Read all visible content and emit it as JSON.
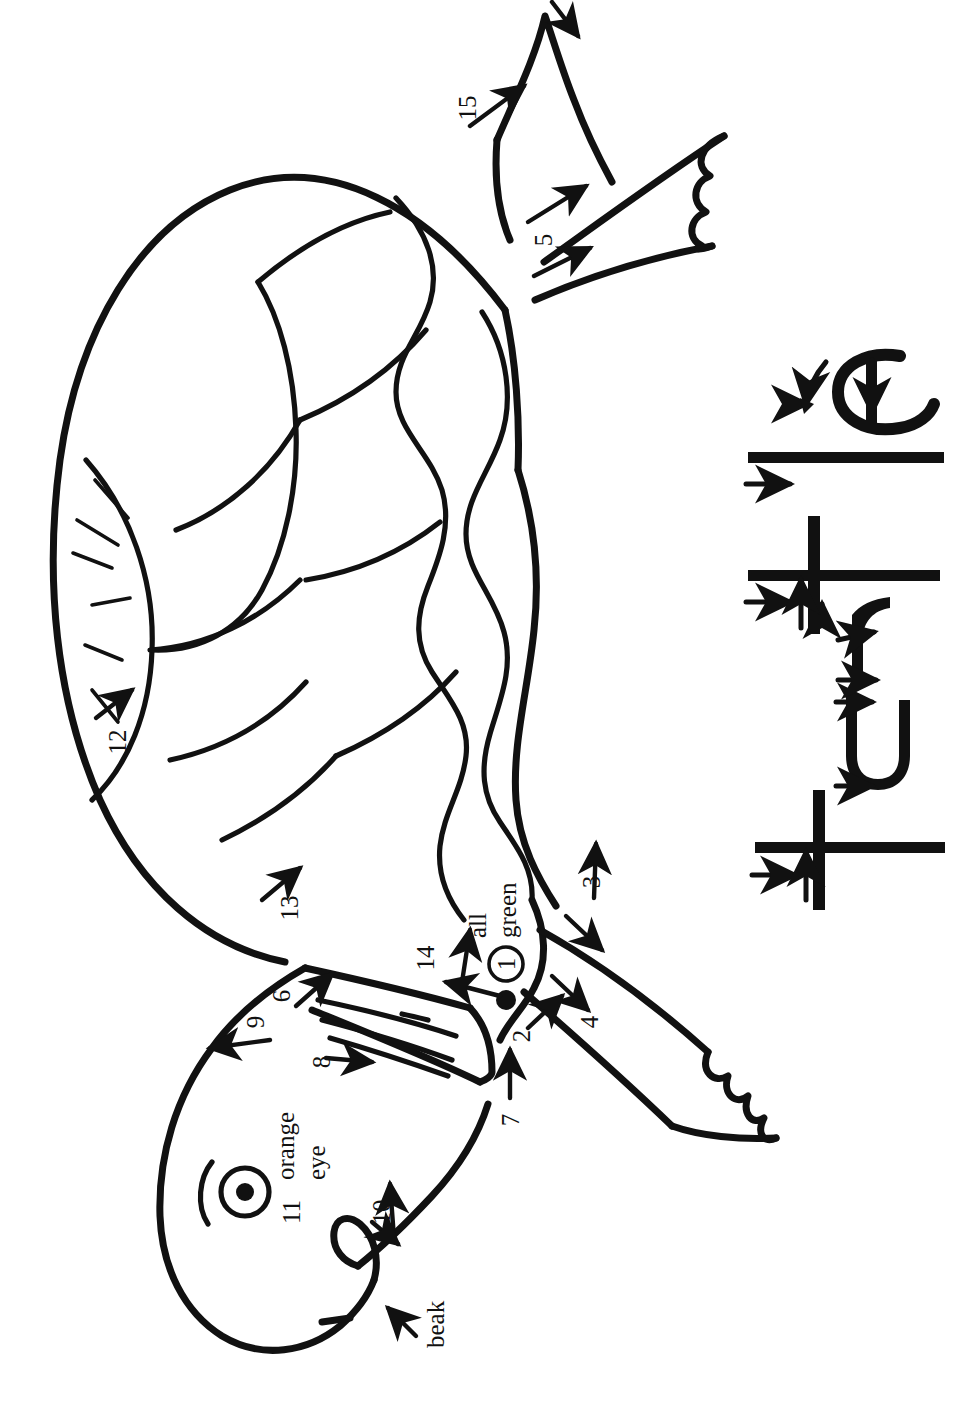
{
  "worksheet": {
    "subject": "turtle",
    "type": "step-by-step drawing and handwriting practice",
    "orientation": "landscape-content-rotated-90"
  },
  "drawing": {
    "title": "Turtle drawing steps",
    "stroke_numbers": [
      "1",
      "2",
      "3",
      "4",
      "5",
      "6",
      "7",
      "8",
      "9",
      "10",
      "11",
      "12",
      "13",
      "14",
      "15"
    ],
    "color_notes": [
      {
        "id": "all-green",
        "circled_number": "1",
        "line1": "all",
        "line2": "green"
      },
      {
        "id": "orange-eye",
        "number": "11",
        "line1": "orange",
        "line2": "eye"
      }
    ],
    "part_labels": [
      {
        "id": "beak",
        "text": "beak"
      }
    ],
    "steps": [
      {
        "n": "1",
        "part": "shell-outline-start",
        "note": "all green"
      },
      {
        "n": "2",
        "part": "front-leg-top"
      },
      {
        "n": "3",
        "part": "front-flipper-upper-edge"
      },
      {
        "n": "4",
        "part": "front-flipper-lower-edge"
      },
      {
        "n": "5",
        "part": "rear-flipper"
      },
      {
        "n": "6",
        "part": "neck-top"
      },
      {
        "n": "7",
        "part": "neck-bottom"
      },
      {
        "n": "8",
        "part": "neck-wrinkles"
      },
      {
        "n": "9",
        "part": "head-top"
      },
      {
        "n": "10",
        "part": "jaw"
      },
      {
        "n": "11",
        "part": "eye"
      },
      {
        "n": "12",
        "part": "shell-front-plate"
      },
      {
        "n": "13",
        "part": "shell-scallop-edge"
      },
      {
        "n": "14",
        "part": "shell-rim"
      },
      {
        "n": "15",
        "part": "tail"
      }
    ]
  },
  "handwriting": {
    "word": "turtle",
    "letters": [
      {
        "char": "t",
        "arrows": 2
      },
      {
        "char": "u",
        "arrows": 2
      },
      {
        "char": "r",
        "arrows": 2
      },
      {
        "char": "t",
        "arrows": 2
      },
      {
        "char": "l",
        "arrows": 1
      },
      {
        "char": "e",
        "arrows": 2
      }
    ]
  },
  "colors": {
    "ink": "#111111",
    "paper": "#ffffff"
  }
}
